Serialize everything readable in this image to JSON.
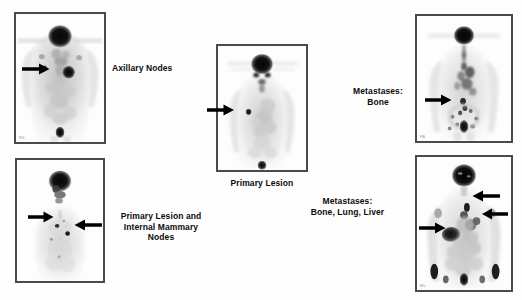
{
  "figure": {
    "type": "medical-imaging-montage",
    "modality": "whole-body PET scan (FDG), maximum intensity projection, grayscale inverted",
    "background_color": "#ffffff",
    "panel_border_color": "#4a4a4a",
    "label_color": "#0c0c0c",
    "arrow_color": "#000000"
  },
  "panels": [
    {
      "id": "panel-axillary-nodes",
      "caption": "Axillary Nodes",
      "caption_align": "left",
      "caption_position": "right",
      "corner_mark": "R.S.",
      "arrows": [
        {
          "direction": "right",
          "target": "right axilla focal uptake"
        }
      ],
      "findings": "Focal hypermetabolic node in the right axilla; intense physiologic uptake in brain, and a focal cardiac/breast lesion in the left chest."
    },
    {
      "id": "panel-primary-lesion-imn",
      "caption": "Primary Lesion and\nInternal Mammary\nNodes",
      "caption_align": "center",
      "caption_position": "right",
      "corner_mark": "",
      "arrows": [
        {
          "direction": "right",
          "target": "primary breast lesion"
        },
        {
          "direction": "left",
          "target": "internal mammary node"
        }
      ],
      "findings": "Anterior chest view showing the primary breast lesion and an adjacent internal mammary nodal focus."
    },
    {
      "id": "panel-primary-lesion",
      "caption": "Primary Lesion",
      "caption_align": "center",
      "caption_position": "below",
      "corner_mark": "",
      "arrows": [
        {
          "direction": "right",
          "target": "primary breast lesion, right chest"
        }
      ],
      "findings": "Whole-body projection with a solitary focal lesion in the right breast."
    },
    {
      "id": "panel-metastases-bone",
      "caption": "Metastases:\nBone",
      "caption_align": "center",
      "caption_position": "left",
      "corner_mark": "P.B.",
      "arrows": [
        {
          "direction": "right",
          "target": "vertebral / pelvic bone metastasis"
        }
      ],
      "findings": "Multiple skeletal foci of increased uptake in the spine and pelvis."
    },
    {
      "id": "panel-metastases-bone-lung-liver",
      "caption": "Metastases:\nBone, Lung, Liver",
      "caption_align": "center",
      "caption_position": "left",
      "corner_mark": "M.L.",
      "arrows": [
        {
          "direction": "left",
          "target": "mediastinal / lung metastasis"
        },
        {
          "direction": "left",
          "target": "left lung metastasis"
        },
        {
          "direction": "right",
          "target": "liver metastasis"
        }
      ],
      "findings": "Widespread disease with pulmonary, hepatic and multiple osseous metastatic deposits."
    }
  ]
}
